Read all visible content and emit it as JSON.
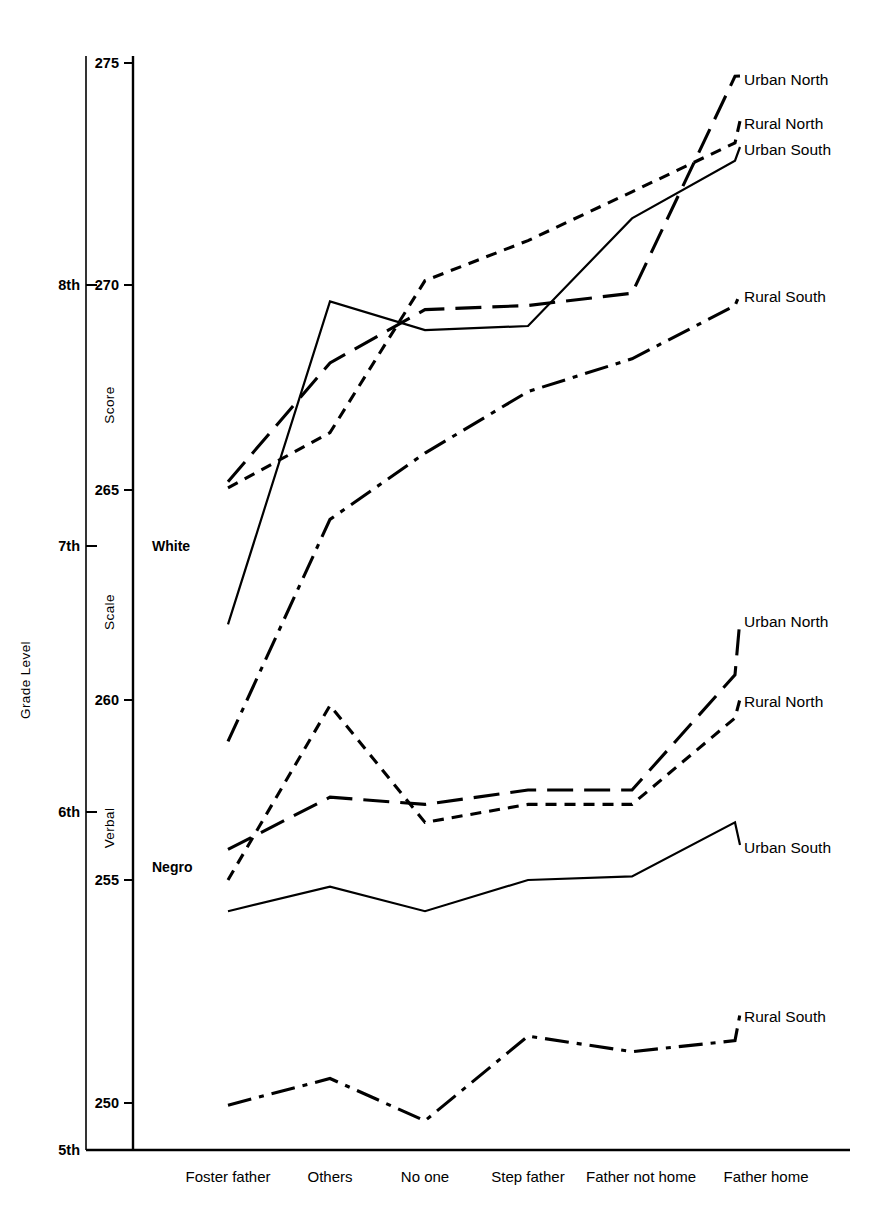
{
  "chart_data": {
    "type": "line",
    "title": "",
    "xlabel": "",
    "ylabel": "Grade Level",
    "y2label": "Score Scale",
    "categories": [
      "Foster father",
      "Others",
      "No one",
      "Step father",
      "Father not home",
      "Father home"
    ],
    "axis_score": {
      "label_parts": [
        "Score",
        "Scale",
        "Verbal"
      ],
      "ticks": [
        275,
        270,
        265,
        260,
        255,
        250
      ],
      "tick_labels": [
        "275",
        "270",
        "265",
        "260",
        "255",
        "250"
      ],
      "range": [
        249,
        275.5
      ]
    },
    "axis_grade": {
      "label": "Grade Level",
      "ticks": [
        "8th",
        "7th",
        "6th",
        "5th"
      ],
      "tick_scores": [
        270.0,
        265.15,
        260.0,
        256.55
      ]
    },
    "group_labels": [
      "White",
      "Negro"
    ],
    "grid": false,
    "legend_position": "right-inline",
    "series": [
      {
        "name": "Urban North",
        "group": "White",
        "style": "long-dash",
        "values": [
          265.2,
          268.1,
          269.4,
          269.5,
          269.8,
          274.7
        ]
      },
      {
        "name": "Rural North",
        "group": "White",
        "style": "short-dash",
        "values": [
          265.05,
          266.4,
          270.1,
          271.0,
          272.1,
          273.2
        ]
      },
      {
        "name": "Urban South",
        "group": "White",
        "style": "solid",
        "values": [
          261.8,
          269.6,
          268.9,
          269.0,
          271.5,
          272.8
        ]
      },
      {
        "name": "Rural South",
        "group": "White",
        "style": "dash-dot",
        "values": [
          258.85,
          264.3,
          265.9,
          267.4,
          268.2,
          269.5
        ]
      },
      {
        "name": "Urban North",
        "group": "Negro",
        "style": "long-dash",
        "values": [
          255.85,
          257.3,
          257.1,
          257.5,
          257.5,
          260.6
        ]
      },
      {
        "name": "Rural North",
        "group": "Negro",
        "style": "short-dash",
        "values": [
          255.0,
          259.85,
          256.6,
          257.1,
          257.1,
          259.5
        ]
      },
      {
        "name": "Urban South",
        "group": "Negro",
        "style": "solid",
        "values": [
          254.3,
          254.85,
          254.3,
          255.0,
          255.1,
          256.6
        ]
      },
      {
        "name": "Rural South",
        "group": "Negro",
        "style": "dash-dot",
        "values": [
          249.95,
          250.55,
          249.6,
          251.5,
          251.15,
          251.4
        ]
      }
    ]
  },
  "labels": {
    "upper_urban_north": "Urban North",
    "upper_rural_north": "Rural North",
    "upper_urban_south": "Urban South",
    "upper_rural_south": "Rural South",
    "lower_urban_north": "Urban North",
    "lower_rural_north": "Rural North",
    "lower_urban_south": "Urban South",
    "lower_rural_south": "Rural South",
    "white": "White",
    "negro": "Negro",
    "grade_level": "Grade Level",
    "score": "Score",
    "scale": "Scale",
    "verbal": "Verbal",
    "g8": "8th",
    "g7": "7th",
    "g6": "6th",
    "g5": "5th",
    "t275": "275",
    "t270": "270",
    "t265": "265",
    "t260": "260",
    "t255": "255",
    "t250": "250",
    "c0": "Foster father",
    "c1": "Others",
    "c2": "No one",
    "c3": "Step father",
    "c4": "Father not home",
    "c5": "Father home"
  }
}
